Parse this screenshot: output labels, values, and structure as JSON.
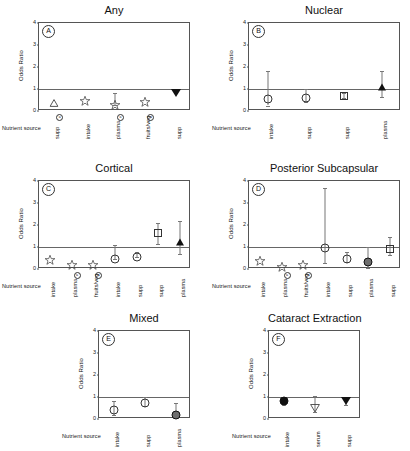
{
  "figure": {
    "axis_label_y": "Odds Ratio",
    "nutrient_source_label": "Nutrient source",
    "yticks": [
      "0",
      "1",
      "2",
      "3",
      "4"
    ],
    "footnote_marker": "a"
  },
  "chart_data": {
    "type": "scatter",
    "ylabel": "Odds Ratio",
    "xlabel": "Nutrient source",
    "ylim": [
      0,
      4
    ],
    "yticks": [
      0,
      1,
      2,
      3,
      4
    ],
    "reference_line": 1,
    "grid": false,
    "legend": "none",
    "panels": [
      {
        "letter": "A",
        "title": "Any",
        "categories": [
          "supp",
          "intake",
          "plasma",
          "fruits/veg",
          "supp"
        ],
        "footnotes": [
          "a",
          "",
          "a",
          "a",
          ""
        ],
        "points": [
          {
            "label": "supp",
            "marker": "triangle-up-open",
            "value": 0.35,
            "ci_low": 0.35,
            "ci_high": 0.35
          },
          {
            "label": "intake",
            "marker": "star-open",
            "value": 0.45,
            "ci_low": 0.45,
            "ci_high": 0.45
          },
          {
            "label": "plasma",
            "marker": "star-open",
            "value": 0.26,
            "ci_low": 0.26,
            "ci_high": 0.82
          },
          {
            "label": "fruits/veg",
            "marker": "star-open",
            "value": 0.43,
            "ci_low": 0.43,
            "ci_high": 0.43
          },
          {
            "label": "supp",
            "marker": "triangle-down-filled",
            "value": 0.8,
            "ci_low": 0.8,
            "ci_high": 1.02
          }
        ]
      },
      {
        "letter": "B",
        "title": "Nuclear",
        "categories": [
          "intake",
          "supp",
          "supp",
          "plasma"
        ],
        "footnotes": [
          "",
          "",
          "",
          ""
        ],
        "points": [
          {
            "label": "intake",
            "marker": "circle-open",
            "value": 0.55,
            "ci_low": 0.25,
            "ci_high": 1.8
          },
          {
            "label": "supp",
            "marker": "circle-open",
            "value": 0.6,
            "ci_low": 0.4,
            "ci_high": 1.0
          },
          {
            "label": "supp",
            "marker": "square-open",
            "value": 0.68,
            "ci_low": 0.57,
            "ci_high": 0.82
          },
          {
            "label": "plasma",
            "marker": "triangle-up-filled",
            "value": 1.1,
            "ci_low": 0.65,
            "ci_high": 1.8
          }
        ]
      },
      {
        "letter": "C",
        "title": "Cortical",
        "categories": [
          "intake",
          "plasma",
          "fruits/veg",
          "intake",
          "supp",
          "supp",
          "plasma"
        ],
        "footnotes": [
          "",
          "a",
          "a",
          "",
          "",
          "",
          ""
        ],
        "points": [
          {
            "label": "intake",
            "marker": "star-open",
            "value": 0.4,
            "ci_low": 0.4,
            "ci_high": 0.4
          },
          {
            "label": "plasma",
            "marker": "star-open",
            "value": 0.16,
            "ci_low": 0.16,
            "ci_high": 0.16
          },
          {
            "label": "fruits/veg",
            "marker": "star-open",
            "value": 0.2,
            "ci_low": 0.2,
            "ci_high": 0.2
          },
          {
            "label": "intake",
            "marker": "circle-open",
            "value": 0.46,
            "ci_low": 0.46,
            "ci_high": 1.1
          },
          {
            "label": "supp",
            "marker": "circle-open",
            "value": 0.56,
            "ci_low": 0.56,
            "ci_high": 0.78
          },
          {
            "label": "supp",
            "marker": "square-open",
            "value": 1.65,
            "ci_low": 1.15,
            "ci_high": 2.1
          },
          {
            "label": "plasma",
            "marker": "triangle-up-filled",
            "value": 1.25,
            "ci_low": 0.7,
            "ci_high": 2.2
          }
        ]
      },
      {
        "letter": "D",
        "title": "Posterior Subcapsular",
        "categories": [
          "intake",
          "plasma",
          "fruits/veg",
          "intake",
          "supp",
          "plasma",
          "supp"
        ],
        "footnotes": [
          "",
          "a",
          "a",
          "",
          "",
          "",
          ""
        ],
        "points": [
          {
            "label": "intake",
            "marker": "star-open",
            "value": 0.36,
            "ci_low": 0.36,
            "ci_high": 0.36
          },
          {
            "label": "plasma",
            "marker": "star-open",
            "value": 0.1,
            "ci_low": 0.1,
            "ci_high": 0.1
          },
          {
            "label": "fruits/veg",
            "marker": "star-open",
            "value": 0.2,
            "ci_low": 0.2,
            "ci_high": 0.2
          },
          {
            "label": "intake",
            "marker": "circle-open",
            "value": 0.95,
            "ci_low": 0.28,
            "ci_high": 3.7
          },
          {
            "label": "supp",
            "marker": "circle-open",
            "value": 0.47,
            "ci_low": 0.3,
            "ci_high": 0.78
          },
          {
            "label": "plasma",
            "marker": "circle-filled",
            "value": 0.32,
            "ci_low": 0.06,
            "ci_high": 0.98
          },
          {
            "label": "supp",
            "marker": "square-open",
            "value": 0.9,
            "ci_low": 0.62,
            "ci_high": 1.45
          }
        ]
      },
      {
        "letter": "E",
        "title": "Mixed",
        "categories": [
          "intake",
          "supp",
          "plasma"
        ],
        "footnotes": [
          "",
          "",
          ""
        ],
        "points": [
          {
            "label": "intake",
            "marker": "circle-open",
            "value": 0.4,
            "ci_low": 0.18,
            "ci_high": 0.82
          },
          {
            "label": "supp",
            "marker": "circle-open",
            "value": 0.75,
            "ci_low": 0.6,
            "ci_high": 1.0
          },
          {
            "label": "plasma",
            "marker": "circle-filled",
            "value": 0.2,
            "ci_low": 0.05,
            "ci_high": 0.72
          }
        ]
      },
      {
        "letter": "F",
        "title": "Cataract Extraction",
        "categories": [
          "intake",
          "serum",
          "supp"
        ],
        "footnotes": [
          "",
          "",
          ""
        ],
        "points": [
          {
            "label": "intake",
            "marker": "circle-filled-black",
            "value": 0.8,
            "ci_low": 0.62,
            "ci_high": 1.02
          },
          {
            "label": "serum",
            "marker": "triangle-down-open",
            "value": 0.5,
            "ci_low": 0.3,
            "ci_high": 1.05
          },
          {
            "label": "supp",
            "marker": "triangle-down-filled",
            "value": 0.8,
            "ci_low": 0.62,
            "ci_high": 1.02
          }
        ]
      }
    ]
  }
}
